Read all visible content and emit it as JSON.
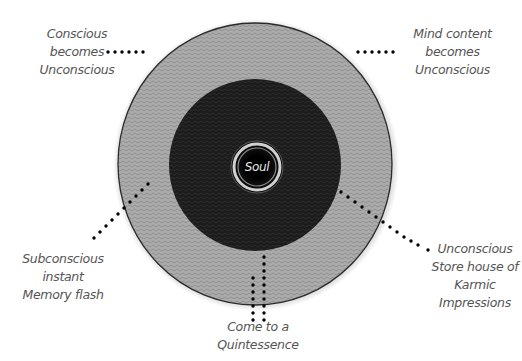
{
  "diagram": {
    "center_label": "Soul",
    "colors": {
      "outer_ring": "#a9a9a9",
      "inner_disc": "#1a1a1a",
      "soul_ring": "#d8d8d8",
      "dots": "#000000",
      "label_text": "#555555"
    },
    "labels": {
      "top_left": [
        "Conscious",
        "becomes",
        "Unconscious"
      ],
      "top_right": [
        "Mind content",
        "becomes",
        "Unconscious"
      ],
      "bottom_left": [
        "Subconscious",
        "instant",
        "Memory flash"
      ],
      "bottom_right": [
        "Unconscious",
        "Store house of",
        "Karmic",
        "Impressions"
      ],
      "bottom_center": [
        "Come to a",
        "Quintessence"
      ]
    }
  }
}
